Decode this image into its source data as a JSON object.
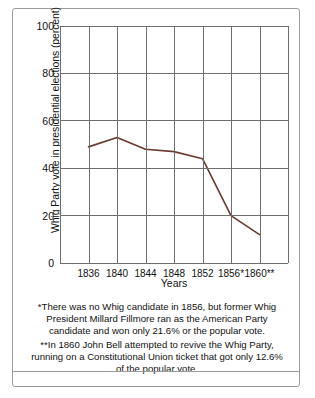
{
  "figure": {
    "x_axis_title": "Years",
    "y_axis_title": "Whig Party vote in presidential elections (percent)"
  },
  "footnotes": [
    "*There was no Whig candidate in 1856, but former Whig President Millard Fillmore ran as the American Party candidate and won only 21.6% or the popular vote.",
    "**In 1860 John Bell attempted to revive the Whig Party, running on a Constitutional Union ticket that got only 12.6% of the popular vote."
  ],
  "chart_data": {
    "type": "line",
    "title": "",
    "xlabel": "Years",
    "ylabel": "Whig Party vote in presidential elections (percent)",
    "categories": [
      "1836",
      "1840",
      "1844",
      "1848",
      "1852",
      "1856*",
      "1860**"
    ],
    "values": [
      49,
      53,
      48,
      47,
      44,
      20,
      12
    ],
    "ylim": [
      0,
      100
    ],
    "yticks": [
      0,
      20,
      40,
      60,
      80,
      100
    ],
    "grid": true,
    "legend": "none",
    "line_color": "#6b3a2e"
  }
}
